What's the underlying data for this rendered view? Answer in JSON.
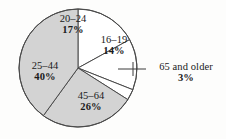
{
  "chart_data": {
    "type": "pie",
    "title": "",
    "subtitle": "",
    "xlabel": "",
    "ylabel": "",
    "legend_position": "none",
    "grid": false,
    "units": "percent",
    "total": 100,
    "start_angle_deg": 0,
    "direction": "clockwise",
    "categories": [
      "20–24",
      "16–19",
      "65 and older",
      "45–64",
      "25–44"
    ],
    "values": [
      17,
      14,
      3,
      26,
      40
    ],
    "value_labels": [
      "17%",
      "14%",
      "3%",
      "26%",
      "40%"
    ],
    "slices": [
      {
        "label": "20–24",
        "value": 17,
        "value_label": "17%",
        "color": "#ffffff",
        "start_deg": 0,
        "end_deg": 61.2,
        "label_placement": "inside"
      },
      {
        "label": "16–19",
        "value": 14,
        "value_label": "14%",
        "color": "#ffffff",
        "start_deg": 61.2,
        "end_deg": 111.6,
        "label_placement": "inside"
      },
      {
        "label": "65 and older",
        "value": 3,
        "value_label": "3%",
        "color": "#ffffff",
        "start_deg": 111.6,
        "end_deg": 122.4,
        "label_placement": "outside-leader"
      },
      {
        "label": "45–64",
        "value": 26,
        "value_label": "26%",
        "color": "#d3d3d3",
        "start_deg": 122.4,
        "end_deg": 216.0,
        "label_placement": "inside"
      },
      {
        "label": "25–44",
        "value": 40,
        "value_label": "40%",
        "color": "#d3d3d3",
        "start_deg": 216.0,
        "end_deg": 360.0,
        "label_placement": "inside"
      }
    ],
    "colors": {
      "light_fill": "#d3d3d3",
      "white_fill": "#ffffff",
      "outline": "#4a4a4a",
      "leader_line": "#3a3a3a",
      "text": "#1a1a1a",
      "background": "#fdfdfc"
    },
    "geometry": {
      "center_x": 78,
      "center_y": 68,
      "radius": 59
    }
  }
}
